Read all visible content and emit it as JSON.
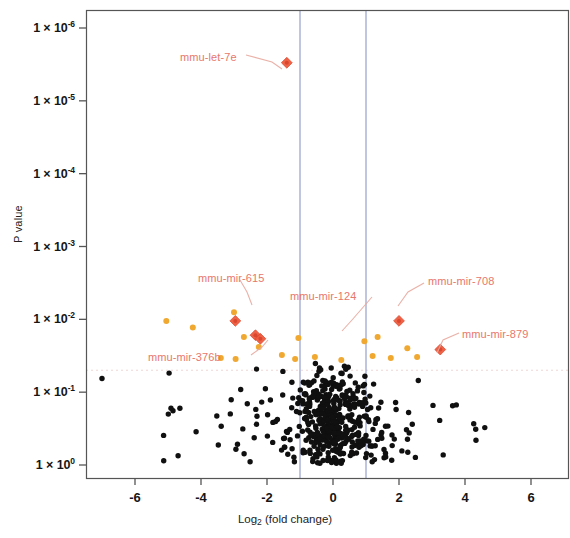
{
  "figure": {
    "type": "volcano-plot",
    "background": "#ffffff"
  },
  "axes": {
    "y": {
      "title": "P value",
      "ticks": [
        {
          "label_mantissa": "1 × 10",
          "label_exponent": "-6",
          "value": 1e-06
        },
        {
          "label_mantissa": "1 × 10",
          "label_exponent": "-5",
          "value": 1e-05
        },
        {
          "label_mantissa": "1 × 10",
          "label_exponent": "-4",
          "value": 0.0001
        },
        {
          "label_mantissa": "1 × 10",
          "label_exponent": "-3",
          "value": 0.001
        },
        {
          "label_mantissa": "1 × 10",
          "label_exponent": "-2",
          "value": 0.01
        },
        {
          "label_mantissa": "1 × 10",
          "label_exponent": "-1",
          "value": 0.1
        },
        {
          "label_mantissa": "1 × 10",
          "label_exponent": "0",
          "value": 1
        }
      ]
    },
    "x": {
      "title_main": "Log",
      "title_sub": "2",
      "title_rest": " (fold change)",
      "ticks": [
        "-6",
        "-4",
        "-2",
        "0",
        "2",
        "4",
        "6"
      ],
      "tick_values": [
        -6,
        -4,
        -2,
        0,
        2,
        4,
        6
      ]
    }
  },
  "thresholds": {
    "vertical": [
      -1,
      1
    ],
    "vertical_color": "#7b86bd",
    "horizontal_p": 0.05,
    "horizontal_color": "#e8c9c4"
  },
  "colors": {
    "point_default": "#101010",
    "point_orange": "#f0a830",
    "point_highlight": "#ef5a3d",
    "label_text": "#e8776b",
    "leader_line": "#e8a89f",
    "axis": "#555555"
  },
  "annotations": [
    {
      "name": "mmu-let-7e",
      "label_x": 180,
      "label_y": 51,
      "point_x": -1.4,
      "point_p": 3e-06
    },
    {
      "name": "mmu-mir-615",
      "label_x": 198,
      "label_y": 272,
      "point_x": -2.96,
      "point_p": 0.0105
    },
    {
      "name": "mmu-mir-124",
      "label_x": 290,
      "label_y": 290,
      "point_x": -2.35,
      "point_p": 0.0165
    },
    {
      "name": "mmu-mir-376b",
      "label_x": 148,
      "label_y": 351,
      "point_x": -2.2,
      "point_p": 0.0185
    },
    {
      "name": "mmu-mir-708",
      "label_x": 428,
      "label_y": 275,
      "point_x": 2.0,
      "point_p": 0.0105
    },
    {
      "name": "mmu-mir-879",
      "label_x": 462,
      "label_y": 328,
      "point_x": 3.25,
      "point_p": 0.026
    }
  ],
  "chart_data": {
    "type": "scatter",
    "title": "",
    "xlabel": "Log2 (fold change)",
    "ylabel": "P value",
    "xlim": [
      -7.6,
      7.1
    ],
    "ylim_p": [
      1.3e-06,
      1.6
    ],
    "y_scale": "log-reversed",
    "grid": false,
    "legend": null,
    "threshold_lines": {
      "x": [
        -1,
        1
      ],
      "p": 0.05
    },
    "series": [
      {
        "name": "highlighted-mirnas",
        "marker": "diamond",
        "color": "#ef5a3d",
        "points": [
          {
            "x": -1.4,
            "p": 3e-06,
            "label": "mmu-let-7e"
          },
          {
            "x": -2.96,
            "p": 0.0105,
            "label": "mmu-mir-615"
          },
          {
            "x": -2.35,
            "p": 0.0165,
            "label": "mmu-mir-124"
          },
          {
            "x": -2.2,
            "p": 0.0185,
            "label": "mmu-mir-376b"
          },
          {
            "x": 2.0,
            "p": 0.0105,
            "label": "mmu-mir-708"
          },
          {
            "x": 3.25,
            "p": 0.026,
            "label": "mmu-mir-879"
          }
        ]
      },
      {
        "name": "significant-orange",
        "marker": "circle",
        "color": "#f0a830",
        "points": [
          {
            "x": -5.05,
            "p": 0.0105
          },
          {
            "x": -4.25,
            "p": 0.013
          },
          {
            "x": -3.0,
            "p": 0.008
          },
          {
            "x": -2.7,
            "p": 0.0175
          },
          {
            "x": -2.25,
            "p": 0.024
          },
          {
            "x": -1.55,
            "p": 0.031
          },
          {
            "x": -1.15,
            "p": 0.035
          },
          {
            "x": -1.05,
            "p": 0.018
          },
          {
            "x": -0.55,
            "p": 0.033
          },
          {
            "x": 0.95,
            "p": 0.02
          },
          {
            "x": 1.2,
            "p": 0.032
          },
          {
            "x": 1.35,
            "p": 0.0175
          },
          {
            "x": 1.75,
            "p": 0.034
          },
          {
            "x": 2.25,
            "p": 0.025
          },
          {
            "x": 2.55,
            "p": 0.033
          },
          {
            "x": -3.4,
            "p": 0.034
          },
          {
            "x": -2.95,
            "p": 0.035
          },
          {
            "x": 0.25,
            "p": 0.036
          }
        ]
      },
      {
        "name": "non-significant",
        "marker": "circle",
        "color": "#101010",
        "n_points": 520,
        "description": "Dense cloud centered near log2FC 0 with p values between 0.04 and 1; isolated point at log2FC -7.0, p 0.065"
      }
    ]
  }
}
